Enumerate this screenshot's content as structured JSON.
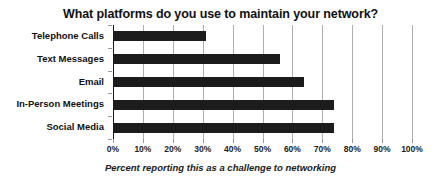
{
  "chart_data": {
    "type": "bar",
    "orientation": "horizontal",
    "title": "What platforms do you use to maintain your network?",
    "xlabel": "Percent reporting this as a challenge to networking",
    "ylabel": "",
    "categories": [
      "Telephone Calls",
      "Text Messages",
      "Email",
      "In-Person Meetings",
      "Social Media"
    ],
    "values": [
      31,
      56,
      64,
      74,
      74
    ],
    "value_unit": "%",
    "xlim": [
      0,
      100
    ],
    "xticks": [
      0,
      10,
      20,
      30,
      40,
      50,
      60,
      70,
      80,
      90,
      100
    ],
    "xtick_labels": [
      "0%",
      "10%",
      "20%",
      "30%",
      "40%",
      "50%",
      "60%",
      "70%",
      "80%",
      "90%",
      "100%"
    ],
    "grid": true,
    "grid_axis": "x",
    "legend": false,
    "legend_position": "none",
    "series": [
      {
        "name": "Percent reporting this as a challenge to networking",
        "color": "#1c1c1c",
        "values": [
          31,
          56,
          64,
          74,
          74
        ]
      }
    ],
    "colors": {
      "bar": "#1c1c1c",
      "gridline": "#b0b0b0",
      "axis": "#1a1a1a",
      "text": "#111111",
      "background": "#ffffff"
    }
  }
}
